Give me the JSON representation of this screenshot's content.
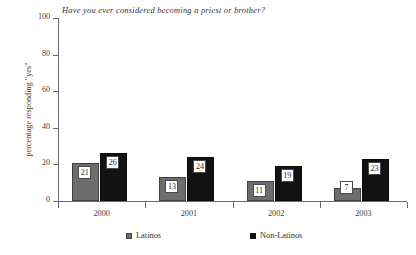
{
  "chart_data": {
    "type": "bar",
    "title": "Have you ever considered becoming a priest or brother?",
    "xlabel": "",
    "ylabel": "percentage responding \"yes\"",
    "categories": [
      "2000",
      "2001",
      "2002",
      "2003"
    ],
    "ylim": [
      0,
      100
    ],
    "yticks": [
      0,
      20,
      40,
      60,
      80,
      100
    ],
    "ytick_labels": [
      "0",
      "20",
      "40",
      "60",
      "80",
      "100"
    ],
    "grid": false,
    "legend_position": "bottom",
    "series": [
      {
        "name": "Latinos",
        "color": "#6d6d6d",
        "values": [
          21,
          13,
          11,
          7
        ],
        "value_labels": [
          "21",
          "13",
          "11",
          "7"
        ]
      },
      {
        "name": "Non-Latinos",
        "color": "#121212",
        "values": [
          26,
          24,
          19,
          23
        ],
        "value_labels": [
          "26",
          "24",
          "19",
          "23"
        ]
      }
    ]
  },
  "legend": {
    "items": [
      {
        "label": "Latinos",
        "swatch": "latino"
      },
      {
        "label": "Non-Latinos",
        "swatch": "nonlatino"
      }
    ]
  }
}
